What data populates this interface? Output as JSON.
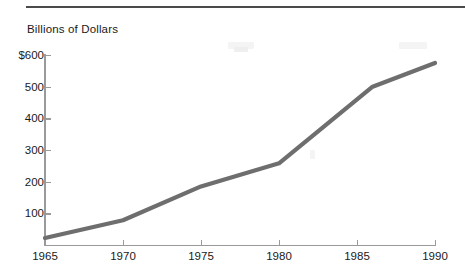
{
  "figure": {
    "axis_title": "Billions of Dollars",
    "line_color": "#6e6e6e",
    "axis_color": "#9a9a9a",
    "rule_color": "#4a4a4a",
    "background": "#ffffff"
  },
  "y_axis": {
    "labels": [
      "$600",
      "500",
      "400",
      "300",
      "200",
      "100"
    ],
    "values": [
      600,
      500,
      400,
      300,
      200,
      100
    ],
    "min": 0,
    "max": 600
  },
  "x_axis": {
    "labels": [
      "1965",
      "1970",
      "1975",
      "1980",
      "1985",
      "1990"
    ],
    "values": [
      1965,
      1970,
      1975,
      1980,
      1985,
      1990
    ],
    "min": 1965,
    "max": 1990
  },
  "chart_data": {
    "type": "line",
    "title": "",
    "subtitle": "",
    "xlabel": "",
    "ylabel": "Billions of Dollars",
    "ylim": [
      0,
      600
    ],
    "xlim": [
      1965,
      1990
    ],
    "grid": false,
    "legend": false,
    "y_tick_labels": [
      "$600",
      "500",
      "400",
      "300",
      "200",
      "100"
    ],
    "y_ticks": [
      100,
      200,
      300,
      400,
      500,
      600
    ],
    "x_tick_labels": [
      "1965",
      "1970",
      "1975",
      "1980",
      "1985",
      "1990"
    ],
    "x_ticks": [
      1965,
      1970,
      1975,
      1980,
      1985,
      1990
    ],
    "series": [
      {
        "name": "Billions of Dollars",
        "color": "#6e6e6e",
        "x": [
          1965,
          1970,
          1975,
          1980,
          1986,
          1990
        ],
        "values": [
          22,
          78,
          185,
          258,
          500,
          575
        ]
      }
    ]
  }
}
